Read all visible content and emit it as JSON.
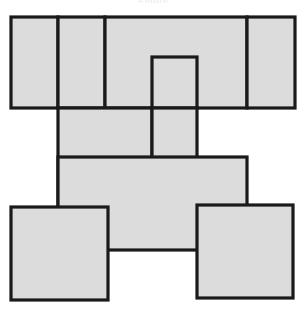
{
  "figure": {
    "title": "Figure",
    "title_visible": false,
    "width": 307,
    "height": 312,
    "background_color": "#ffffff",
    "fill_color": "#dcdcdc",
    "stroke_color": "#1a1a1a",
    "stroke_width": 3.2,
    "shape_type": "rectangle",
    "shape_count": 10,
    "shapes": [
      {
        "name": "rect-top-left",
        "x": 11,
        "y": 17,
        "w": 47,
        "h": 91
      },
      {
        "name": "rect-top-second",
        "x": 58,
        "y": 17,
        "w": 47,
        "h": 91
      },
      {
        "name": "rect-top-wide",
        "x": 105,
        "y": 17,
        "w": 142,
        "h": 91
      },
      {
        "name": "rect-top-right",
        "x": 247,
        "y": 17,
        "w": 48,
        "h": 91
      },
      {
        "name": "rect-top-inner-small",
        "x": 152,
        "y": 57,
        "w": 45,
        "h": 51
      },
      {
        "name": "rect-mid-left",
        "x": 58,
        "y": 108,
        "w": 94,
        "h": 100
      },
      {
        "name": "rect-mid-center",
        "x": 152,
        "y": 108,
        "w": 45,
        "h": 100
      },
      {
        "name": "rect-mid-right-band",
        "x": 58,
        "y": 157,
        "w": 189,
        "h": 93
      },
      {
        "name": "rect-bottom-left",
        "x": 11,
        "y": 207,
        "w": 97,
        "h": 93
      },
      {
        "name": "rect-bottom-right",
        "x": 197,
        "y": 205,
        "w": 96,
        "h": 93
      }
    ]
  }
}
